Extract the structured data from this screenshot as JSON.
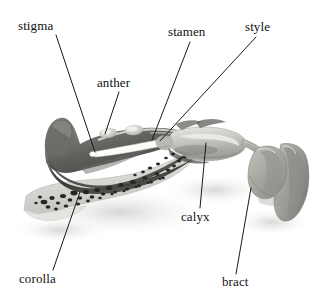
{
  "figure": {
    "width": 327,
    "height": 304,
    "background_color": "#ffffff",
    "image_type": "grayscale-photograph"
  },
  "labels": {
    "stigma": "stigma",
    "anther": "anther",
    "stamen": "stamen",
    "style": "style",
    "calyx": "calyx",
    "corolla": "corolla",
    "bract": "bract"
  },
  "annotations": [
    {
      "id": "stigma",
      "text": "stigma",
      "text_x": 18,
      "text_y": 20,
      "leader": {
        "x1": 56,
        "y1": 35,
        "x2": 95,
        "y2": 152
      }
    },
    {
      "id": "anther",
      "text": "anther",
      "text_x": 97,
      "text_y": 77,
      "leader": {
        "x1": 119,
        "y1": 92,
        "x2": 105,
        "y2": 134
      }
    },
    {
      "id": "stamen",
      "text": "stamen",
      "text_x": 168,
      "text_y": 26,
      "leader": {
        "x1": 190,
        "y1": 42,
        "x2": 152,
        "y2": 140
      }
    },
    {
      "id": "style",
      "text": "style",
      "text_x": 245,
      "text_y": 21,
      "leader": {
        "x1": 256,
        "y1": 37,
        "x2": 160,
        "y2": 141
      }
    },
    {
      "id": "calyx",
      "text": "calyx",
      "text_x": 181,
      "text_y": 211,
      "leader": {
        "x1": 206,
        "y1": 143,
        "x2": 200,
        "y2": 208
      }
    },
    {
      "id": "corolla",
      "text": "corolla",
      "text_x": 19,
      "text_y": 273,
      "leader": {
        "x1": 80,
        "y1": 192,
        "x2": 53,
        "y2": 270
      }
    },
    {
      "id": "bract",
      "text": "bract",
      "text_x": 222,
      "text_y": 276,
      "leader": {
        "x1": 251,
        "y1": 188,
        "x2": 236,
        "y2": 274
      }
    }
  ],
  "colors": {
    "text": "#111111",
    "leader_line": "#1a1a1a",
    "background": "#ffffff",
    "corolla_upper_dark": "#4a4a4a",
    "corolla_lower_light": "#d8d8d6",
    "style_white": "#fbfbfa",
    "anther_light": "#cfcfcb",
    "calyx_mid": "#bdbdb9",
    "bract_gray": "#a9a9a5",
    "spots_dark": "#2b2b2b",
    "shadow": "#e6e6e4"
  }
}
